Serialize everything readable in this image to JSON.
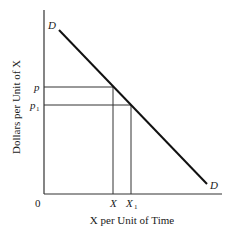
{
  "diagram": {
    "type": "demand-curve",
    "y_axis_label": "Dollars per Unit of X",
    "x_axis_label": "X per Unit of Time",
    "origin_label": "0",
    "curve": {
      "name": "D",
      "start_label": "D",
      "end_label": "D"
    },
    "price_levels": [
      {
        "label": "p",
        "subscript": ""
      },
      {
        "label": "p",
        "subscript": "1"
      }
    ],
    "quantity_levels": [
      {
        "label": "X",
        "subscript": ""
      },
      {
        "label": "X",
        "subscript": "1"
      }
    ],
    "colors": {
      "line": "#1a1a1a",
      "axis": "#333333",
      "background": "#ffffff"
    }
  }
}
